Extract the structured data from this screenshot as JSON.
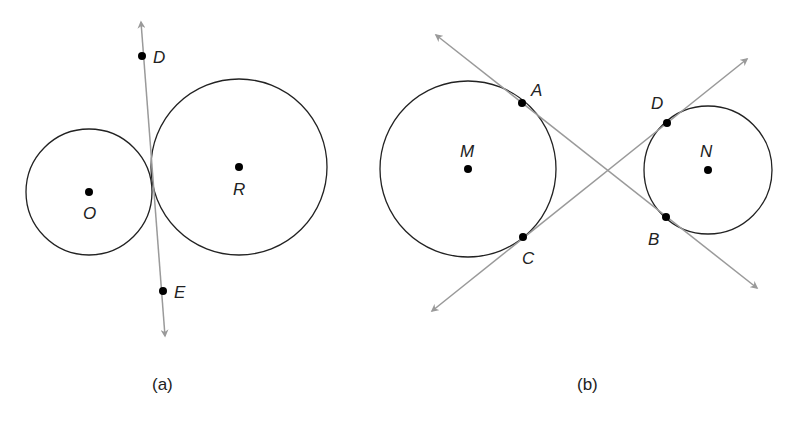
{
  "figure_a": {
    "caption": "(a)",
    "circles": [
      {
        "center_label": "O",
        "cx": 89,
        "cy": 192,
        "r": 63
      },
      {
        "center_label": "R",
        "cx": 239,
        "cy": 167,
        "r": 88
      }
    ],
    "line": {
      "x1": 138,
      "y1": 18,
      "x2": 166,
      "y2": 340
    },
    "points": [
      {
        "label": "D",
        "x": 142,
        "y": 56
      },
      {
        "label": "E",
        "x": 163,
        "y": 291
      }
    ]
  },
  "figure_b": {
    "caption": "(b)",
    "circles": [
      {
        "center_label": "M",
        "cx": 468,
        "cy": 169,
        "r": 88
      },
      {
        "center_label": "N",
        "cx": 708,
        "cy": 170,
        "r": 64
      }
    ],
    "lines": [
      {
        "name": "line-AB",
        "x1": 434,
        "y1": 33,
        "x2": 760,
        "y2": 290
      },
      {
        "name": "line-CD",
        "x1": 429,
        "y1": 313,
        "x2": 750,
        "y2": 57
      }
    ],
    "points": [
      {
        "label": "A",
        "x": 522,
        "y": 103
      },
      {
        "label": "C",
        "x": 523,
        "y": 237
      },
      {
        "label": "D",
        "x": 667,
        "y": 123
      },
      {
        "label": "B",
        "x": 666,
        "y": 217
      }
    ]
  },
  "colors": {
    "circle": "#222222",
    "line": "#9a9a9a",
    "point": "#000000"
  }
}
